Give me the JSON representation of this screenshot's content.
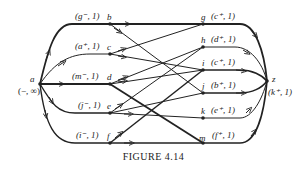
{
  "figure": {
    "caption": "FIGURE 4.14",
    "nodes": [
      {
        "id": "a",
        "label": "a",
        "sublabel": "(−, ∞)",
        "x": 40,
        "y": 84
      },
      {
        "id": "b",
        "label": "b",
        "tag": "(g⁻, 1)",
        "x": 110,
        "y": 24
      },
      {
        "id": "c",
        "label": "c",
        "tag": "(a⁺, 1)",
        "x": 110,
        "y": 54
      },
      {
        "id": "d",
        "label": "d",
        "tag": "(m⁻, 1)",
        "x": 110,
        "y": 84
      },
      {
        "id": "e",
        "label": "e",
        "tag": "(j⁻, 1)",
        "x": 110,
        "y": 113
      },
      {
        "id": "f",
        "label": "f",
        "tag": "(i⁻, 1)",
        "x": 110,
        "y": 143
      },
      {
        "id": "g",
        "label": "g",
        "tag": "(c⁺, 1)",
        "x": 203,
        "y": 24
      },
      {
        "id": "h",
        "label": "h",
        "tag": "(d⁺, 1)",
        "x": 203,
        "y": 47
      },
      {
        "id": "i",
        "label": "i",
        "tag": "(c⁺, 1)",
        "x": 203,
        "y": 70
      },
      {
        "id": "j",
        "label": "j",
        "tag": "(b⁺, 1)",
        "x": 203,
        "y": 93
      },
      {
        "id": "k",
        "label": "k",
        "tag": "(e⁺, 1)",
        "x": 203,
        "y": 118
      },
      {
        "id": "m",
        "label": "m",
        "tag": "(f⁺, 1)",
        "x": 203,
        "y": 143
      },
      {
        "id": "z",
        "label": "z",
        "sublabel": "(k⁺, 1)",
        "x": 267,
        "y": 81
      }
    ]
  }
}
